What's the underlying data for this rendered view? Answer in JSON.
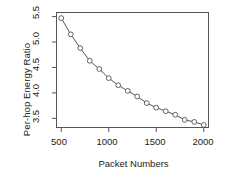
{
  "chart_data": {
    "type": "line",
    "title": "",
    "xlabel": "Packet Numbers",
    "ylabel": "Per-hop Energy Ratio",
    "x": [
      500,
      600,
      700,
      800,
      900,
      1000,
      1100,
      1200,
      1300,
      1400,
      1500,
      1600,
      1700,
      1800,
      1900,
      2000
    ],
    "values": [
      5.47,
      5.15,
      4.88,
      4.63,
      4.47,
      4.29,
      4.15,
      4.04,
      3.93,
      3.8,
      3.71,
      3.64,
      3.57,
      3.47,
      3.43,
      3.37
    ],
    "series": [
      {
        "name": "Per-hop Energy Ratio",
        "values": [
          5.47,
          5.15,
          4.88,
          4.63,
          4.47,
          4.29,
          4.15,
          4.04,
          3.93,
          3.8,
          3.71,
          3.64,
          3.57,
          3.47,
          3.43,
          3.37
        ]
      }
    ],
    "xlim": [
      450,
      2050
    ],
    "ylim": [
      3.32,
      5.58
    ],
    "xticks": [
      500,
      1000,
      1500,
      2000
    ],
    "xtick_labels": [
      "500",
      "1000",
      "1500",
      "2000"
    ],
    "yticks": [
      3.5,
      4.0,
      4.5,
      5.0,
      5.5
    ],
    "ytick_labels": [
      "3.5",
      "4.0",
      "4.5",
      "5.0",
      "5.5"
    ],
    "grid": false,
    "legend": null,
    "marker": "open-circle",
    "line_color": "#555555",
    "marker_color": "#555555",
    "frame_color": "#555555",
    "background": "#ffffff"
  },
  "axes": {
    "y_tick_0": "3.5",
    "y_tick_1": "4.0",
    "y_tick_2": "4.5",
    "y_tick_3": "5.0",
    "y_tick_4": "5.5",
    "x_tick_0": "500",
    "x_tick_1": "1000",
    "x_tick_2": "1500",
    "x_tick_3": "2000"
  }
}
